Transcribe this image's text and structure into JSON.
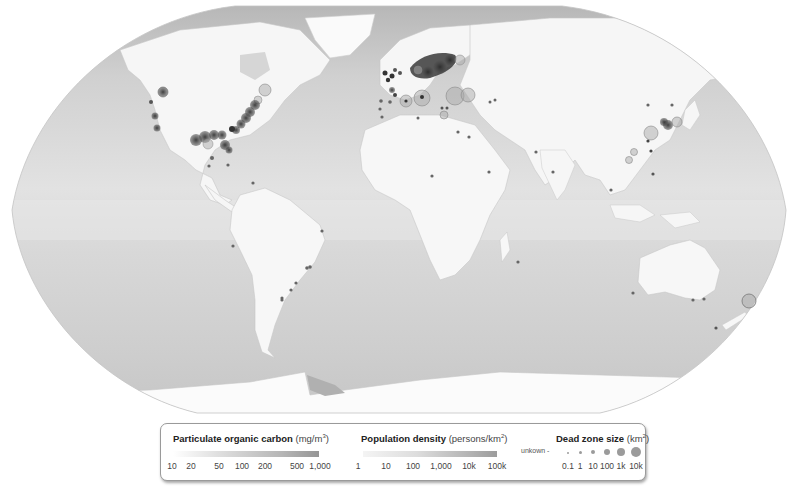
{
  "map": {
    "projection": "Robinson-like world map, grayscale",
    "colors": {
      "background": "#ffffff",
      "ocean_light": "#e4e4e4",
      "ocean_mid": "#d2d2d2",
      "ocean_dark": "#b8b8b8",
      "land": "#f7f7f7",
      "land_shade": "#ececec",
      "ice": "#fbfbfb",
      "dead_zone_fill": "#8a8a8a",
      "dead_zone_dark": "#3c3c3c",
      "dead_zone_stroke": "#6a6a6a"
    },
    "dead_zone_clusters": [
      {
        "region": "US East Coast",
        "density": "very high"
      },
      {
        "region": "Gulf of Mexico",
        "density": "very high"
      },
      {
        "region": "US West Coast",
        "density": "medium"
      },
      {
        "region": "Baltic Sea",
        "density": "very high"
      },
      {
        "region": "North Sea / Europe",
        "density": "high"
      },
      {
        "region": "Black Sea",
        "density": "medium"
      },
      {
        "region": "Mediterranean",
        "density": "medium"
      },
      {
        "region": "East China Sea / Japan",
        "density": "high"
      },
      {
        "region": "South America east coast",
        "density": "low"
      },
      {
        "region": "Australia / New Zealand",
        "density": "low"
      }
    ]
  },
  "legend": {
    "poc": {
      "title": "Particulate organic carbon",
      "unit_base": "(mg/m",
      "unit_sup": "3",
      "unit_end": ")",
      "ticks": [
        "10",
        "20",
        "50",
        "100",
        "200",
        "500",
        "1,000"
      ]
    },
    "population": {
      "title": "Population density",
      "unit_base": "(persons/km",
      "unit_sup": "2",
      "unit_end": ")",
      "ticks": [
        "1",
        "10",
        "100",
        "1,000",
        "10k",
        "100k"
      ]
    },
    "dead_zone": {
      "title": "Dead zone size",
      "unit_base": "(km",
      "unit_sup": "2",
      "unit_end": ")",
      "unknown_label": "unkown -",
      "ticks": [
        "0.1",
        "1",
        "10",
        "100",
        "1k",
        "10k"
      ]
    }
  }
}
